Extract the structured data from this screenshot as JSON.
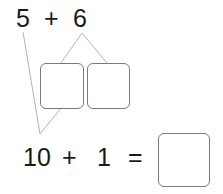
{
  "problem": {
    "top_expression": {
      "a": "5",
      "op": "+",
      "b": "6"
    },
    "bottom_expression": {
      "a": "10",
      "op": "+",
      "b": "1",
      "eq": "="
    },
    "decomposition_boxes": [
      {
        "value": ""
      },
      {
        "value": ""
      }
    ],
    "answer_box": {
      "value": ""
    }
  },
  "colors": {
    "text": "#1a1a1a",
    "box_border": "#7a7a7a",
    "line": "#b5b5b5"
  }
}
